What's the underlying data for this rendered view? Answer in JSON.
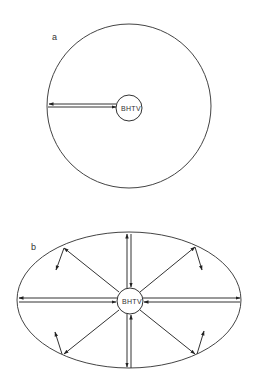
{
  "panel_a": {
    "label": "a",
    "tool_label": "BHTV",
    "shape": "circle"
  },
  "panel_b": {
    "label": "b",
    "tool_label": "BHTV",
    "shape": "ellipse"
  },
  "colors": {
    "line": "#333333",
    "background": "#ffffff"
  }
}
